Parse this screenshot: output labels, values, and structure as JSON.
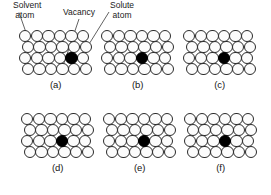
{
  "figure": {
    "background_color": "#ffffff",
    "atom_outline_color": "#2b2b2b",
    "solvent_fill_color": "#fcfcfc",
    "solute_fill_color": "#000000",
    "leader_line_color": "#3a3a3a"
  },
  "annotations": [
    {
      "id": "solvent-atom",
      "text": "Solvent\n atom",
      "x": 13,
      "y": 1
    },
    {
      "id": "vacancy",
      "text": "Vacancy",
      "x": 63,
      "y": 8
    },
    {
      "id": "solute-atom",
      "text": "Solute\natom",
      "x": 110,
      "y": 1
    }
  ],
  "lattice": {
    "rows": 4,
    "cols": 6,
    "atom_diameter": 12.4,
    "col_spacing": 11.6,
    "row_spacing": 11.0,
    "row_offsets": [
      0,
      2.6,
      0,
      2.6
    ]
  },
  "panels": [
    {
      "caption": "(a)",
      "x": 19,
      "y": 30,
      "solute": {
        "row": 2,
        "col": 4
      }
    },
    {
      "caption": "(b)",
      "x": 101,
      "y": 30,
      "solute": {
        "row": 2,
        "col": 3
      }
    },
    {
      "caption": "(c)",
      "x": 183,
      "y": 30,
      "solute": {
        "row": 2,
        "col": 3
      }
    },
    {
      "caption": "(d)",
      "x": 21,
      "y": 113,
      "solute": {
        "row": 2,
        "col": 3
      }
    },
    {
      "caption": "(e)",
      "x": 103,
      "y": 113,
      "solute": {
        "row": 2,
        "col": 3
      }
    },
    {
      "caption": "(f)",
      "x": 184,
      "y": 113,
      "solute": {
        "row": 2,
        "col": 3
      }
    }
  ]
}
